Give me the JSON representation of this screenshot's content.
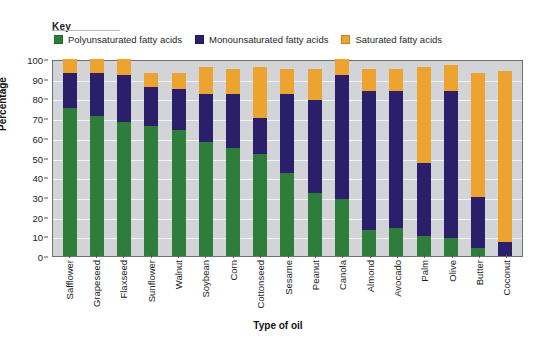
{
  "key": {
    "title": "Key"
  },
  "axes": {
    "ylabel": "Percentage",
    "xlabel": "Type of oil",
    "yticks": [
      "100",
      "90",
      "80",
      "70",
      "60",
      "50",
      "40",
      "30",
      "20",
      "10",
      "0"
    ]
  },
  "colors": {
    "polyunsaturated": "#2e7d3a",
    "monounsaturated": "#2b1f6b",
    "saturated": "#eda32f",
    "plot_background": "#d3d4d8",
    "gridline": "#f2f3f5",
    "axis": "#6f7073"
  },
  "chart_data": {
    "type": "bar",
    "subtype": "stacked-column",
    "title": "",
    "xlabel": "Type of oil",
    "ylabel": "Percentage",
    "ylim": [
      0,
      100
    ],
    "ytick_step": 10,
    "grid": true,
    "legend_position": "top-left",
    "categories": [
      "Safflower",
      "Grapeseed",
      "Flaxseed",
      "Sunflower",
      "Walnut",
      "Soybean",
      "Corn",
      "Cottonseed",
      "Sesame",
      "Peanut",
      "Canola",
      "Almond",
      "Avocado",
      "Palm",
      "Olive",
      "Butter",
      "Coconut"
    ],
    "series": [
      {
        "name": "Polyunsaturated fatty acids",
        "color": "#2e7d3a",
        "values": [
          75,
          71,
          68,
          66,
          64,
          58,
          55,
          52,
          42,
          32,
          29,
          13,
          14,
          10,
          9,
          4,
          0
        ]
      },
      {
        "name": "Monounsaturated fatty acids",
        "color": "#2b1f6b",
        "values": [
          18,
          22,
          24,
          20,
          21,
          24,
          27,
          18,
          40,
          47,
          63,
          71,
          70,
          37,
          75,
          26,
          7
        ]
      },
      {
        "name": "Saturated fatty acids",
        "color": "#eda32f",
        "values": [
          7,
          7,
          8,
          7,
          8,
          14,
          13,
          26,
          13,
          16,
          8,
          11,
          11,
          49,
          13,
          63,
          87
        ]
      }
    ],
    "cumulative_tops": {
      "polyunsaturated": [
        75,
        71,
        68,
        66,
        64,
        58,
        55,
        52,
        42,
        32,
        29,
        13,
        14,
        10,
        9,
        4,
        0
      ],
      "monounsaturated": [
        93,
        93,
        92,
        86,
        85,
        82,
        82,
        70,
        82,
        79,
        92,
        84,
        84,
        47,
        84,
        30,
        7
      ],
      "total": [
        100,
        100,
        100,
        93,
        93,
        96,
        95,
        96,
        95,
        95,
        100,
        95,
        95,
        96,
        97,
        93,
        94
      ]
    },
    "legend": [
      "Polyunsaturated fatty acids",
      "Monounsaturated fatty acids",
      "Saturated fatty acids"
    ]
  }
}
